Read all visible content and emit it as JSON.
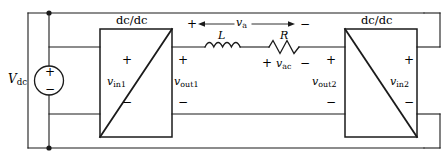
{
  "figure": {
    "type": "circuit-schematic",
    "line_color": "#1a1a1a",
    "background": "#ffffff"
  },
  "source": {
    "name": "dc-voltage-source",
    "label": "V",
    "label_sub": "dc",
    "plus": "+",
    "minus": "−"
  },
  "converters": [
    {
      "id": "left",
      "title": "dc/dc",
      "port_in": {
        "label": "v",
        "label_sub": "in1",
        "plus": "+",
        "minus": "−"
      },
      "port_out": {
        "label": "v",
        "label_sub": "out1",
        "plus": "+",
        "minus": "−"
      },
      "diagonal": "bottom-left-to-top-right"
    },
    {
      "id": "right",
      "title": "dc/dc",
      "port_in": {
        "label": "v",
        "label_sub": "in2",
        "plus": "+",
        "minus": "−"
      },
      "port_out": {
        "label": "v",
        "label_sub": "out2",
        "plus": "+",
        "minus": "−"
      },
      "diagonal": "top-left-to-bottom-right"
    }
  ],
  "link": {
    "inductor": {
      "label": "L"
    },
    "resistor": {
      "label": "R"
    },
    "branch_voltage": {
      "label": "v",
      "label_sub": "a",
      "plus": "+",
      "minus": "−",
      "arrow_left": "◀",
      "arrow_right": "▶"
    },
    "ac_voltage": {
      "label": "v",
      "label_sub": "ac",
      "plus": "+",
      "minus": "−"
    }
  }
}
